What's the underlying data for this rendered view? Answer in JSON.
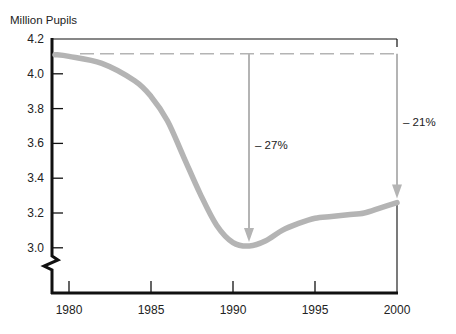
{
  "chart_data": {
    "type": "line",
    "title": "",
    "ylabel": "Million Pupils",
    "xlabel": "",
    "ylim": [
      3.0,
      4.2
    ],
    "y_axis_break": true,
    "grid": false,
    "x_ticks": [
      1980,
      1985,
      1990,
      1995,
      2000
    ],
    "y_ticks": [
      4.2,
      4.0,
      3.8,
      3.6,
      3.4,
      3.2,
      3.0
    ],
    "x_tick_labels": [
      "1980",
      "1985",
      "1990",
      "1995",
      "2000"
    ],
    "y_tick_labels": [
      "4.2",
      "4.0",
      "3.8",
      "3.6",
      "3.4",
      "3.2",
      "3.0"
    ],
    "series": [
      {
        "name": "Pupils",
        "color": "#b4b4b4",
        "x": [
          1979,
          1980,
          1982,
          1984,
          1985,
          1986,
          1987,
          1988,
          1989,
          1990,
          1991,
          1992,
          1993,
          1994,
          1995,
          1996,
          1997,
          1998,
          1999,
          2000
        ],
        "values": [
          4.11,
          4.1,
          4.06,
          3.96,
          3.87,
          3.73,
          3.52,
          3.31,
          3.13,
          3.03,
          3.01,
          3.04,
          3.1,
          3.14,
          3.17,
          3.18,
          3.19,
          3.2,
          3.23,
          3.26
        ]
      }
    ],
    "reference_line": {
      "value": 4.11,
      "style": "dashed",
      "color": "#b4b4b4"
    },
    "annotations": [
      {
        "text": "– 27%",
        "x": 1991,
        "from": 4.11,
        "to": 3.01
      },
      {
        "text": "– 21%",
        "x": 2000,
        "from": 4.11,
        "to": 3.26
      }
    ]
  }
}
